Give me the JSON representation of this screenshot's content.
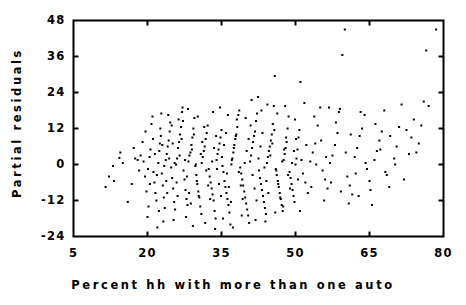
{
  "chart_data": {
    "type": "scatter",
    "title": "",
    "xlabel": "Percent hh with more than one auto",
    "ylabel": "Partial residuals",
    "xlim": [
      5,
      80
    ],
    "ylim": [
      -24,
      48
    ],
    "xticks": [
      5,
      20,
      35,
      50,
      65,
      80
    ],
    "yticks": [
      48,
      36,
      24,
      12,
      0,
      -12,
      -24
    ],
    "xtick_labels": [
      "5",
      "20",
      "35",
      "50",
      "65",
      "80"
    ],
    "ytick_labels": [
      "48",
      "36",
      "24",
      "12",
      "0",
      "-12",
      "-24"
    ],
    "grid": false,
    "legend": null,
    "marker": "dot",
    "marker_color": "#000000",
    "frame_color": "#000000",
    "background": "#ffffff",
    "n_points": 420,
    "points": [
      [
        11.5,
        -7.5
      ],
      [
        13.0,
        -0.5
      ],
      [
        14.5,
        4.0
      ],
      [
        14.3,
        2.2
      ],
      [
        13.2,
        -5.5
      ],
      [
        16.0,
        -12.5
      ],
      [
        17.5,
        2.0
      ],
      [
        18.0,
        1.5
      ],
      [
        18.6,
        3.0
      ],
      [
        19.2,
        1.0
      ],
      [
        19.5,
        -4.0
      ],
      [
        19.8,
        -9.0
      ],
      [
        20.0,
        -17.5
      ],
      [
        20.2,
        -14.0
      ],
      [
        20.4,
        2.5
      ],
      [
        20.6,
        5.0
      ],
      [
        20.8,
        13.5
      ],
      [
        21.0,
        16.0
      ],
      [
        21.2,
        -2.5
      ],
      [
        21.4,
        -6.0
      ],
      [
        21.6,
        -9.5
      ],
      [
        21.8,
        -12.0
      ],
      [
        22.0,
        -21.0
      ],
      [
        22.2,
        0.5
      ],
      [
        22.4,
        4.5
      ],
      [
        22.5,
        7.0
      ],
      [
        22.7,
        9.5
      ],
      [
        22.9,
        -3.0
      ],
      [
        23.1,
        -7.0
      ],
      [
        23.3,
        -11.0
      ],
      [
        23.5,
        -14.5
      ],
      [
        23.7,
        1.5
      ],
      [
        23.9,
        3.5
      ],
      [
        24.1,
        6.0
      ],
      [
        24.3,
        8.0
      ],
      [
        24.5,
        11.0
      ],
      [
        24.6,
        14.0
      ],
      [
        24.8,
        -1.0
      ],
      [
        25.0,
        -4.5
      ],
      [
        25.2,
        -8.0
      ],
      [
        25.4,
        -12.5
      ],
      [
        25.6,
        -15.0
      ],
      [
        25.8,
        0.0
      ],
      [
        26.0,
        2.0
      ],
      [
        26.2,
        5.5
      ],
      [
        26.4,
        7.5
      ],
      [
        26.6,
        10.0
      ],
      [
        26.8,
        12.5
      ],
      [
        27.0,
        17.5
      ],
      [
        27.1,
        19.0
      ],
      [
        27.3,
        -2.0
      ],
      [
        27.5,
        -5.0
      ],
      [
        27.7,
        -8.5
      ],
      [
        27.9,
        -11.5
      ],
      [
        28.1,
        -13.5
      ],
      [
        28.3,
        1.0
      ],
      [
        28.5,
        3.0
      ],
      [
        28.7,
        4.0
      ],
      [
        28.9,
        6.5
      ],
      [
        29.1,
        9.0
      ],
      [
        29.3,
        12.0
      ],
      [
        29.5,
        15.5
      ],
      [
        29.7,
        -0.5
      ],
      [
        29.9,
        -3.5
      ],
      [
        30.1,
        -6.5
      ],
      [
        30.3,
        -9.0
      ],
      [
        30.5,
        -11.0
      ],
      [
        30.7,
        -14.0
      ],
      [
        30.9,
        -16.5
      ],
      [
        31.0,
        0.5
      ],
      [
        31.2,
        2.5
      ],
      [
        31.4,
        4.5
      ],
      [
        31.6,
        6.0
      ],
      [
        31.8,
        8.5
      ],
      [
        32.0,
        10.5
      ],
      [
        32.2,
        13.0
      ],
      [
        32.4,
        -1.5
      ],
      [
        32.6,
        -4.0
      ],
      [
        32.8,
        -6.0
      ],
      [
        33.0,
        -8.0
      ],
      [
        33.2,
        -10.0
      ],
      [
        33.4,
        -12.0
      ],
      [
        33.6,
        -15.5
      ],
      [
        33.8,
        -18.0
      ],
      [
        34.0,
        1.5
      ],
      [
        34.2,
        3.5
      ],
      [
        34.4,
        5.0
      ],
      [
        34.6,
        7.0
      ],
      [
        34.8,
        9.0
      ],
      [
        35.0,
        11.5
      ],
      [
        35.2,
        -0.5
      ],
      [
        35.4,
        -2.5
      ],
      [
        35.6,
        -5.5
      ],
      [
        35.8,
        -7.5
      ],
      [
        36.0,
        -9.5
      ],
      [
        36.2,
        -11.5
      ],
      [
        36.4,
        -13.5
      ],
      [
        36.6,
        -16.0
      ],
      [
        36.8,
        -20.0
      ],
      [
        37.0,
        0.0
      ],
      [
        37.2,
        2.0
      ],
      [
        37.4,
        4.0
      ],
      [
        37.6,
        6.5
      ],
      [
        37.8,
        8.5
      ],
      [
        38.0,
        10.0
      ],
      [
        38.2,
        12.5
      ],
      [
        38.4,
        16.5
      ],
      [
        38.6,
        18.0
      ],
      [
        38.8,
        -1.0
      ],
      [
        39.0,
        -3.0
      ],
      [
        39.2,
        -5.0
      ],
      [
        39.4,
        -7.0
      ],
      [
        39.6,
        -9.0
      ],
      [
        39.8,
        -11.0
      ],
      [
        40.0,
        -13.0
      ],
      [
        40.2,
        -15.0
      ],
      [
        40.4,
        -17.0
      ],
      [
        40.6,
        -19.5
      ],
      [
        40.8,
        1.0
      ],
      [
        41.0,
        3.0
      ],
      [
        41.2,
        5.5
      ],
      [
        41.4,
        7.5
      ],
      [
        41.6,
        9.5
      ],
      [
        41.8,
        11.0
      ],
      [
        42.0,
        14.5
      ],
      [
        42.2,
        17.0
      ],
      [
        42.4,
        22.5
      ],
      [
        42.6,
        -2.0
      ],
      [
        42.8,
        -4.5
      ],
      [
        43.0,
        -6.5
      ],
      [
        43.2,
        -8.5
      ],
      [
        43.4,
        -10.5
      ],
      [
        43.6,
        -12.5
      ],
      [
        43.8,
        -14.5
      ],
      [
        44.0,
        -16.5
      ],
      [
        44.2,
        0.5
      ],
      [
        44.4,
        2.5
      ],
      [
        44.6,
        4.5
      ],
      [
        44.8,
        6.0
      ],
      [
        45.0,
        8.0
      ],
      [
        45.2,
        10.0
      ],
      [
        45.4,
        13.5
      ],
      [
        45.6,
        19.5
      ],
      [
        45.8,
        29.5
      ],
      [
        46.0,
        -1.5
      ],
      [
        46.2,
        -3.5
      ],
      [
        46.4,
        -5.5
      ],
      [
        46.6,
        -7.5
      ],
      [
        46.8,
        -9.5
      ],
      [
        47.0,
        -11.5
      ],
      [
        47.2,
        -13.5
      ],
      [
        47.4,
        -15.5
      ],
      [
        47.6,
        1.5
      ],
      [
        47.8,
        3.5
      ],
      [
        48.0,
        5.5
      ],
      [
        48.2,
        7.5
      ],
      [
        48.4,
        12.0
      ],
      [
        48.6,
        16.0
      ],
      [
        48.8,
        -2.5
      ],
      [
        49.0,
        -4.5
      ],
      [
        49.2,
        -6.5
      ],
      [
        49.4,
        -8.5
      ],
      [
        49.6,
        -10.5
      ],
      [
        49.8,
        -12.5
      ],
      [
        50.0,
        0.0
      ],
      [
        50.2,
        2.0
      ],
      [
        50.4,
        5.0
      ],
      [
        50.6,
        9.0
      ],
      [
        50.8,
        11.5
      ],
      [
        51.0,
        27.5
      ],
      [
        51.5,
        -3.0
      ],
      [
        52.0,
        -6.0
      ],
      [
        52.5,
        -9.5
      ],
      [
        53.0,
        1.0
      ],
      [
        53.5,
        4.0
      ],
      [
        54.0,
        7.0
      ],
      [
        54.5,
        13.0
      ],
      [
        55.0,
        19.0
      ],
      [
        55.5,
        -2.0
      ],
      [
        56.0,
        -5.0
      ],
      [
        56.5,
        -8.0
      ],
      [
        57.0,
        0.5
      ],
      [
        57.5,
        3.0
      ],
      [
        58.0,
        6.5
      ],
      [
        58.5,
        10.5
      ],
      [
        59.0,
        18.5
      ],
      [
        59.5,
        36.5
      ],
      [
        60.0,
        45.0
      ],
      [
        60.5,
        -4.0
      ],
      [
        61.0,
        -7.0
      ],
      [
        61.5,
        -10.0
      ],
      [
        62.0,
        2.5
      ],
      [
        62.5,
        5.5
      ],
      [
        63.0,
        9.5
      ],
      [
        63.5,
        12.0
      ],
      [
        64.0,
        16.5
      ],
      [
        64.5,
        -1.5
      ],
      [
        65.0,
        -5.5
      ],
      [
        65.5,
        -13.5
      ],
      [
        66.0,
        1.5
      ],
      [
        66.5,
        4.5
      ],
      [
        67.0,
        8.0
      ],
      [
        67.5,
        11.0
      ],
      [
        68.0,
        18.0
      ],
      [
        68.5,
        -3.5
      ],
      [
        69.0,
        -7.5
      ],
      [
        70.0,
        2.0
      ],
      [
        70.5,
        6.0
      ],
      [
        71.0,
        12.5
      ],
      [
        71.5,
        20.0
      ],
      [
        72.0,
        -5.0
      ],
      [
        73.0,
        3.5
      ],
      [
        73.5,
        9.0
      ],
      [
        74.0,
        15.0
      ],
      [
        75.0,
        7.0
      ],
      [
        75.5,
        13.0
      ],
      [
        76.0,
        21.0
      ],
      [
        76.5,
        38.0
      ],
      [
        78.5,
        45.0
      ],
      [
        12.2,
        -4.0
      ],
      [
        15.0,
        0.5
      ],
      [
        16.8,
        -6.5
      ],
      [
        17.2,
        5.5
      ],
      [
        18.3,
        -2.0
      ],
      [
        19.0,
        7.5
      ],
      [
        19.6,
        11.0
      ],
      [
        20.1,
        -1.5
      ],
      [
        20.5,
        -6.5
      ],
      [
        21.1,
        8.5
      ],
      [
        21.5,
        3.5
      ],
      [
        21.9,
        -3.5
      ],
      [
        22.3,
        -15.5
      ],
      [
        22.6,
        12.0
      ],
      [
        23.0,
        6.5
      ],
      [
        23.4,
        -0.5
      ],
      [
        23.8,
        -5.5
      ],
      [
        24.0,
        -9.5
      ],
      [
        24.4,
        2.0
      ],
      [
        24.9,
        13.0
      ],
      [
        25.1,
        7.0
      ],
      [
        25.5,
        0.5
      ],
      [
        25.9,
        -6.0
      ],
      [
        26.1,
        -10.5
      ],
      [
        26.5,
        3.0
      ],
      [
        26.9,
        8.5
      ],
      [
        27.2,
        14.5
      ],
      [
        27.6,
        1.5
      ],
      [
        28.0,
        -4.0
      ],
      [
        28.4,
        -9.5
      ],
      [
        28.8,
        -13.0
      ],
      [
        29.0,
        5.0
      ],
      [
        29.4,
        10.0
      ],
      [
        29.8,
        0.0
      ],
      [
        30.0,
        -5.5
      ],
      [
        30.4,
        -10.5
      ],
      [
        30.8,
        3.5
      ],
      [
        31.1,
        7.5
      ],
      [
        31.5,
        12.5
      ],
      [
        31.9,
        -2.0
      ],
      [
        32.3,
        -7.0
      ],
      [
        32.7,
        -11.5
      ],
      [
        33.1,
        1.0
      ],
      [
        33.5,
        5.5
      ],
      [
        33.9,
        9.5
      ],
      [
        34.1,
        -1.5
      ],
      [
        34.5,
        -6.5
      ],
      [
        34.9,
        -10.5
      ],
      [
        35.1,
        2.5
      ],
      [
        35.5,
        6.5
      ],
      [
        35.9,
        10.5
      ],
      [
        36.1,
        -3.0
      ],
      [
        36.5,
        -7.5
      ],
      [
        36.9,
        -12.5
      ],
      [
        37.1,
        1.5
      ],
      [
        37.5,
        5.5
      ],
      [
        37.9,
        9.5
      ],
      [
        38.1,
        15.0
      ],
      [
        38.5,
        -2.5
      ],
      [
        38.9,
        -7.0
      ],
      [
        39.3,
        -11.5
      ],
      [
        39.7,
        0.5
      ],
      [
        40.1,
        4.5
      ],
      [
        40.5,
        8.5
      ],
      [
        40.9,
        13.0
      ],
      [
        41.3,
        -3.5
      ],
      [
        41.7,
        -8.0
      ],
      [
        42.1,
        -12.0
      ],
      [
        42.5,
        2.0
      ],
      [
        42.9,
        6.0
      ],
      [
        43.3,
        10.5
      ],
      [
        43.7,
        -1.0
      ],
      [
        44.1,
        -5.5
      ],
      [
        44.5,
        -9.5
      ],
      [
        44.9,
        3.0
      ],
      [
        45.3,
        7.0
      ],
      [
        45.7,
        11.5
      ],
      [
        46.1,
        -2.0
      ],
      [
        46.5,
        -6.5
      ],
      [
        46.9,
        -11.0
      ],
      [
        47.3,
        1.0
      ],
      [
        47.7,
        5.0
      ],
      [
        48.1,
        9.0
      ],
      [
        48.5,
        -3.5
      ],
      [
        48.9,
        -8.0
      ],
      [
        49.3,
        0.5
      ],
      [
        49.7,
        4.5
      ],
      [
        50.1,
        8.5
      ],
      [
        50.5,
        -5.0
      ],
      [
        51.2,
        1.5
      ],
      [
        52.2,
        6.5
      ],
      [
        53.2,
        -7.5
      ],
      [
        54.2,
        0.0
      ],
      [
        55.2,
        8.0
      ],
      [
        56.2,
        2.5
      ],
      [
        57.2,
        -6.0
      ],
      [
        58.2,
        14.0
      ],
      [
        59.2,
        -9.0
      ],
      [
        60.2,
        4.0
      ],
      [
        61.2,
        10.0
      ],
      [
        62.2,
        -3.0
      ],
      [
        63.2,
        17.5
      ],
      [
        64.2,
        0.5
      ],
      [
        65.2,
        -8.5
      ],
      [
        66.2,
        13.5
      ],
      [
        67.2,
        5.0
      ],
      [
        68.2,
        -2.5
      ],
      [
        69.2,
        9.5
      ],
      [
        70.2,
        0.0
      ],
      [
        72.5,
        11.5
      ],
      [
        74.5,
        4.0
      ],
      [
        77.0,
        19.5
      ],
      [
        22.8,
        17.0
      ],
      [
        24.2,
        16.5
      ],
      [
        26.3,
        15.0
      ],
      [
        28.2,
        18.5
      ],
      [
        30.2,
        16.0
      ],
      [
        33.3,
        17.5
      ],
      [
        34.7,
        19.0
      ],
      [
        36.3,
        16.5
      ],
      [
        39.9,
        15.5
      ],
      [
        41.1,
        21.5
      ],
      [
        43.1,
        18.0
      ],
      [
        44.3,
        20.0
      ],
      [
        46.3,
        17.0
      ],
      [
        47.9,
        19.5
      ],
      [
        49.9,
        15.0
      ],
      [
        51.8,
        20.5
      ],
      [
        53.8,
        16.0
      ],
      [
        56.8,
        19.0
      ],
      [
        58.8,
        17.5
      ],
      [
        23.2,
        -19.0
      ],
      [
        25.3,
        -18.5
      ],
      [
        27.8,
        -17.5
      ],
      [
        29.2,
        -20.5
      ],
      [
        31.7,
        -19.5
      ],
      [
        33.7,
        -21.5
      ],
      [
        35.3,
        -18.0
      ],
      [
        37.3,
        -21.0
      ],
      [
        39.1,
        -17.0
      ],
      [
        41.9,
        -18.5
      ],
      [
        43.9,
        -19.0
      ],
      [
        45.9,
        -16.0
      ],
      [
        47.5,
        -14.0
      ],
      [
        50.9,
        -15.5
      ],
      [
        55.8,
        -12.0
      ],
      [
        60.8,
        -13.0
      ],
      [
        62.8,
        -10.5
      ]
    ]
  },
  "figure": {
    "axis_line_width": 2,
    "tick_length": 5,
    "marker_size": 2
  }
}
